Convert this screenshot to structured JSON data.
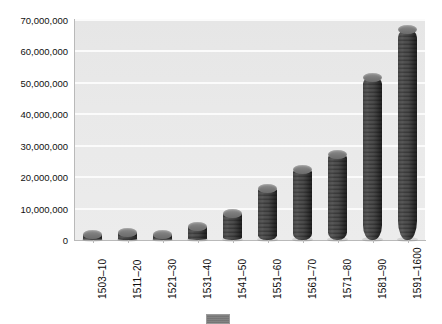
{
  "chart": {
    "type": "bar",
    "background_color": "#ffffff",
    "plot_background_color": "#e9e9e9",
    "bar_color": "#7b7b7b",
    "gridline_color": "#fbfbfb",
    "axis_color": "#b9b9b9",
    "text_color": "#0d0d0d"
  },
  "legend": {
    "entries": [
      {
        "label": "",
        "color": "#7b7b7b",
        "swatch_name": "series-swatch"
      }
    ],
    "position": "bottom",
    "visible": true
  },
  "yaxis": {
    "ticks": [
      {
        "value": 0,
        "label": "0"
      },
      {
        "value": 10000000,
        "label": "10,000,000"
      },
      {
        "value": 20000000,
        "label": "20,000,000"
      },
      {
        "value": 30000000,
        "label": "30,000,000"
      },
      {
        "value": 40000000,
        "label": "40,000,000"
      },
      {
        "value": 50000000,
        "label": "50,000,000"
      },
      {
        "value": 60000000,
        "label": "60,000,000"
      },
      {
        "value": 70000000,
        "label": "70,000,000"
      }
    ]
  },
  "chart_data": {
    "type": "bar",
    "title": "",
    "xlabel": "",
    "ylabel": "",
    "ylim": [
      0,
      70000000
    ],
    "grid": true,
    "legend_position": "bottom",
    "categories": [
      "1503–10",
      "1511–20",
      "1521–30",
      "1531–40",
      "1541–50",
      "1551–60",
      "1561–70",
      "1571–80",
      "1581–90",
      "1591–1600"
    ],
    "values": [
      1500000,
      2600000,
      1800000,
      4600000,
      8600000,
      16500000,
      22500000,
      27500000,
      52000000,
      67000000
    ],
    "tick_labels_y": [
      "0",
      "10,000,000",
      "20,000,000",
      "30,000,000",
      "40,000,000",
      "50,000,000",
      "60,000,000",
      "70,000,000"
    ]
  }
}
